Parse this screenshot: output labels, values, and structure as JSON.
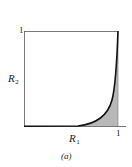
{
  "figure": {
    "caption": "(a)",
    "x_axis": {
      "label": "R",
      "label_sub": "1",
      "max_tick": "1"
    },
    "y_axis": {
      "label": "R",
      "label_sub": "2",
      "max_tick": "1"
    },
    "curve": {
      "description": "convex curve from (0,0) rising steeply to (1,1)",
      "shaded_region": "area under curve"
    },
    "colors": {
      "curve": "#111111",
      "axis": "#555555",
      "shade": "#b8b8b8"
    }
  }
}
